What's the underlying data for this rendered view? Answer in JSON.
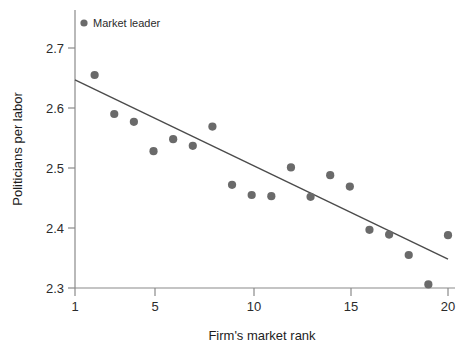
{
  "chart_data": {
    "type": "scatter",
    "title": "",
    "xlabel": "Firm's market rank",
    "ylabel": "Politicians per labor",
    "xlim": [
      1,
      20
    ],
    "ylim": [
      2.3,
      2.7
    ],
    "xticks": [
      1,
      5,
      10,
      15,
      20
    ],
    "xtick_labels": [
      "1",
      "5",
      "10",
      "15",
      "20"
    ],
    "yticks": [
      2.3,
      2.4,
      2.5,
      2.6,
      2.7
    ],
    "ytick_labels": [
      "2.3",
      "2.4",
      "2.5",
      "2.6",
      "2.7"
    ],
    "grid": false,
    "legend_position": "top-left-inside",
    "legend": [
      {
        "name": "Market leader",
        "marker": "circle",
        "color": "#6a6a6a"
      }
    ],
    "series": [
      {
        "name": "Market leader",
        "marker": "circle",
        "color": "#6a6a6a",
        "x": [
          2,
          3,
          4,
          5,
          6,
          7,
          8,
          9,
          10,
          11,
          12,
          13,
          14,
          15,
          16,
          17,
          18,
          19,
          20
        ],
        "y": [
          2.655,
          2.59,
          2.577,
          2.528,
          2.548,
          2.537,
          2.569,
          2.472,
          2.455,
          2.453,
          2.501,
          2.452,
          2.488,
          2.469,
          2.397,
          2.389,
          2.355,
          2.306,
          2.388
        ],
        "points": [
          {
            "rank": 2,
            "value": 2.655
          },
          {
            "rank": 3,
            "value": 2.59
          },
          {
            "rank": 4,
            "value": 2.577
          },
          {
            "rank": 5,
            "value": 2.528
          },
          {
            "rank": 6,
            "value": 2.548
          },
          {
            "rank": 7,
            "value": 2.537
          },
          {
            "rank": 8,
            "value": 2.569
          },
          {
            "rank": 9,
            "value": 2.472
          },
          {
            "rank": 10,
            "value": 2.455
          },
          {
            "rank": 11,
            "value": 2.453
          },
          {
            "rank": 12,
            "value": 2.501
          },
          {
            "rank": 13,
            "value": 2.452
          },
          {
            "rank": 14,
            "value": 2.488
          },
          {
            "rank": 15,
            "value": 2.469
          },
          {
            "rank": 16,
            "value": 2.397
          },
          {
            "rank": 17,
            "value": 2.389
          },
          {
            "rank": 18,
            "value": 2.355
          },
          {
            "rank": 19,
            "value": 2.306
          },
          {
            "rank": 20,
            "value": 2.388
          }
        ]
      }
    ],
    "fit_line": {
      "name": "linear fit",
      "color": "#4b4b4b",
      "x_start": 1,
      "y_start": 2.647,
      "x_end": 20,
      "y_end": 2.348
    },
    "colors": {
      "marker": "#6a6a6a",
      "fit_line": "#4b4b4b",
      "axis": "#7a7a7a",
      "text": "#2b2b2b",
      "background": "#ffffff"
    }
  }
}
